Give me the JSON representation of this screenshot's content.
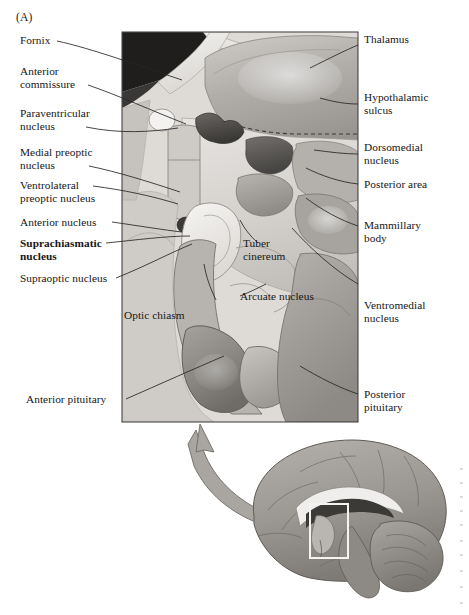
{
  "figure": {
    "panel_letter": "(A)",
    "illustration_style": "grayscale airbrush anatomical rendering"
  },
  "colors": {
    "page_background": "#ffffff",
    "text": "#161616",
    "leader_line": "#2b2b2b",
    "panel_border": "#555555",
    "plate_light": "#e2e0dd",
    "plate_mid": "#b9b6b2",
    "plate_dark": "#8a8782",
    "plate_darkest": "#2a2927",
    "arrow_fill": "#a9a6a2",
    "arrow_stroke": "#6e6b67",
    "inset_box": "#f2f1ef"
  },
  "labels_left": [
    {
      "id": "fornix",
      "text": "Fornix",
      "bold": false
    },
    {
      "id": "anterior-commissure",
      "text": "Anterior\ncommissure",
      "bold": false
    },
    {
      "id": "paraventricular-nucleus",
      "text": "Paraventricular\nnucleus",
      "bold": false
    },
    {
      "id": "medial-preoptic-nucleus",
      "text": "Medial preoptic\nnucleus",
      "bold": false
    },
    {
      "id": "ventrolateral-preoptic-nucleus",
      "text": "Ventrolateral\npreoptic nucleus",
      "bold": false
    },
    {
      "id": "anterior-nucleus",
      "text": "Anterior nucleus",
      "bold": false
    },
    {
      "id": "suprachiasmatic-nucleus",
      "text": "Suprachiasmatic\nnucleus",
      "bold": true
    },
    {
      "id": "supraoptic-nucleus",
      "text": "Supraoptic nucleus",
      "bold": false
    },
    {
      "id": "anterior-pituitary",
      "text": "Anterior pituitary",
      "bold": false
    }
  ],
  "labels_right": [
    {
      "id": "thalamus",
      "text": "Thalamus",
      "bold": false
    },
    {
      "id": "hypothalamic-sulcus",
      "text": "Hypothalamic\nsulcus",
      "bold": false
    },
    {
      "id": "dorsomedial-nucleus",
      "text": "Dorsomedial\nnucleus",
      "bold": false
    },
    {
      "id": "posterior-area",
      "text": "Posterior area",
      "bold": false
    },
    {
      "id": "mammillary-body",
      "text": "Mammillary\nbody",
      "bold": false
    },
    {
      "id": "ventromedial-nucleus",
      "text": "Ventromedial\nnucleus",
      "bold": false
    },
    {
      "id": "posterior-pituitary",
      "text": "Posterior\npituitary",
      "bold": false
    }
  ],
  "labels_inner": [
    {
      "id": "tuber-cinereum",
      "text": "Tuber\ncinereum",
      "bold": false
    },
    {
      "id": "optic-chiasm",
      "text": "Optic chiasm",
      "bold": false
    },
    {
      "id": "arcuate-nucleus",
      "text": "Arcuate nucleus",
      "bold": false
    }
  ],
  "inset": {
    "description": "whole-brain midsagittal view with locator box over the hypothalamus",
    "locator_box_label": "",
    "arrow_semantic": "magnification-callout-arrow"
  }
}
